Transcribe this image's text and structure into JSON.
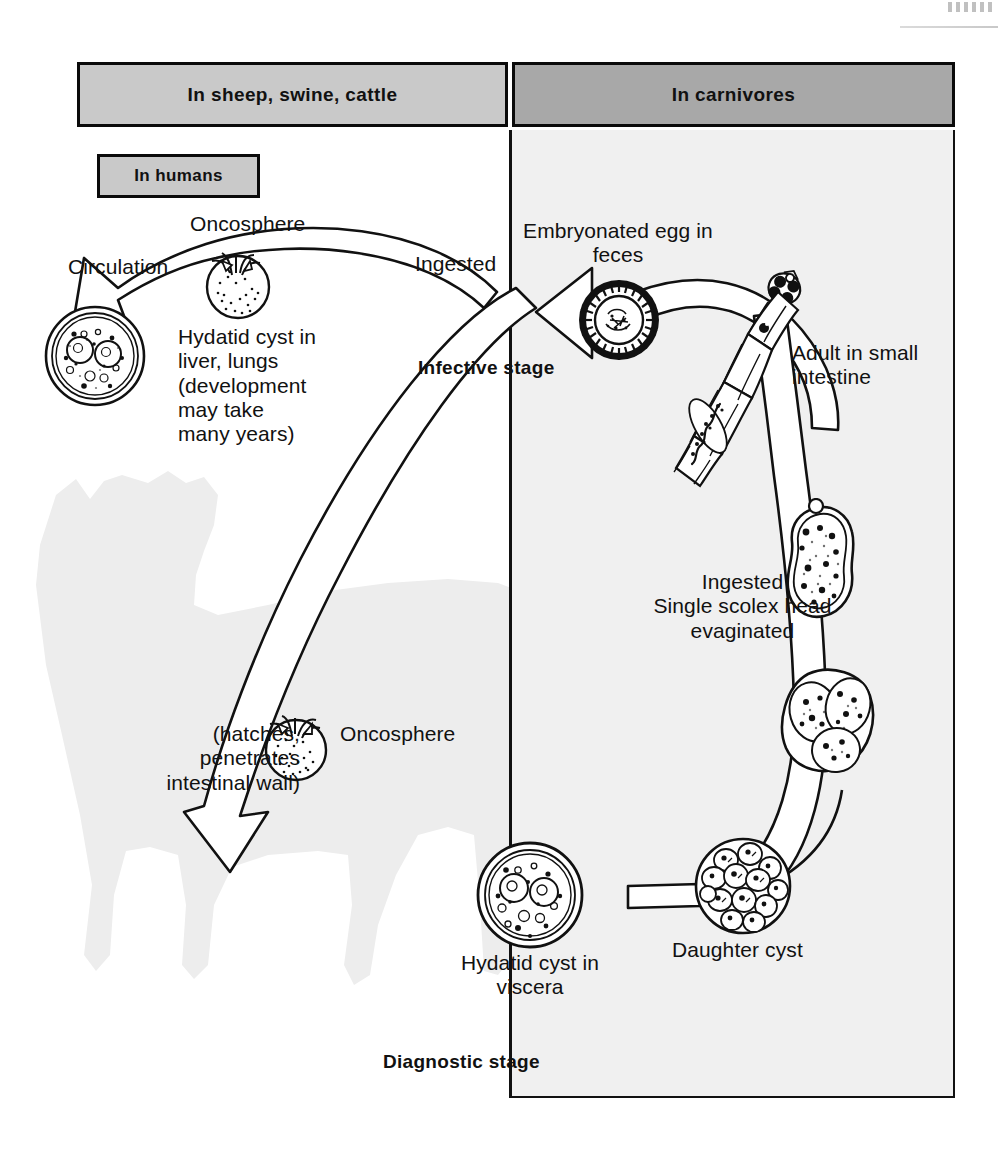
{
  "figure": {
    "type": "parasite-life-cycle-diagram"
  },
  "headers": {
    "left": "In sheep, swine, cattle",
    "right": "In carnivores",
    "humans": "In humans"
  },
  "labels": {
    "oncosphere_top": "Oncosphere",
    "circulation": "Circulation",
    "hydatid_cyst_liver": "Hydatid cyst in\nliver, lungs\n(development\nmay take\nmany years)",
    "ingested_top": "Ingested",
    "infective_stage": "Infective stage",
    "embryonated_egg": "Embryonated egg in\nfeces",
    "adult_small_intestine": "Adult in small\nintestine",
    "ingested_scolex": "Ingested\nSingle scolex head\nevaginated",
    "hatches_penetrates": "(hatches,\npenetrates\nintestinal wall)",
    "oncosphere_bottom": "Oncosphere",
    "hydatid_cyst_viscera": "Hydatid cyst in\nviscera",
    "daughter_cyst": "Daughter cyst",
    "diagnostic_stage": "Diagnostic stage"
  },
  "illustrations": {
    "oncosphere_top": "oncosphere-embryo-hooklets",
    "hydatid_cyst_liver": "hydatid-cyst-brood-capsules",
    "embryonated_egg": "embryonated-egg-striated-shell",
    "adult_tapeworm": "adult-tapeworm-scolex-proglottids",
    "protoscolex_1": "protoscolex-evaginating",
    "protoscolex_2": "protoscolex-pair",
    "oncosphere_bottom": "oncosphere-embryo-hooklets",
    "hydatid_cyst_viscera": "hydatid-cyst-brood-capsules",
    "daughter_cyst": "daughter-cyst-with-protoscolices",
    "cow_silhouette": "cow-silhouette",
    "dog_silhouette": "dog-silhouette"
  },
  "colors": {
    "header_left_fill": "#c9c9c9",
    "header_right_fill": "#a8a8a8",
    "carnivore_panel_fill": "#f0f0f0",
    "dog_silhouette_fill": "#b4b4b4",
    "cow_silhouette_fill": "#ededed",
    "ink": "#111111"
  }
}
